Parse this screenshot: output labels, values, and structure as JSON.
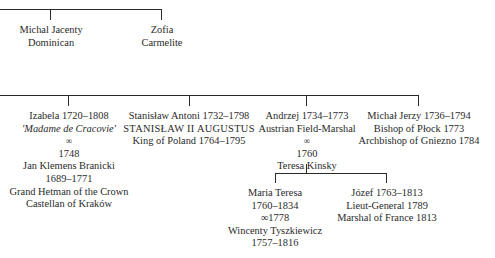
{
  "generation_1": [
    {
      "lines": [
        "Michal Jacenty",
        "Dominican"
      ]
    },
    {
      "lines": [
        "Zofia",
        "Carmelite"
      ]
    }
  ],
  "generation_2": [
    {
      "name": "Izabela 1720–1808",
      "nickname": "'Madame de Cracovie'",
      "marriage_symbol": "∞",
      "marriage_year": "1748",
      "spouse": "Jan Klemens Branicki",
      "spouse_dates": "1689–1771",
      "titles": [
        "Grand Hetman of the Crown",
        "Castellan of Kraków"
      ]
    },
    {
      "name": "Stanisław Antoni 1732–1798",
      "regnal_name": "STANISŁAW II AUGUSTUS",
      "title": "King of Poland 1764–1795"
    },
    {
      "name": "Andrzej 1734–1773",
      "title": "Austrian Field-Marshal",
      "marriage_symbol": "∞",
      "marriage_year": "1760",
      "spouse": "Teresa Kinsky"
    },
    {
      "name": "Michał Jerzy 1736–1794",
      "titles": [
        "Bishop of Płock 1773",
        "Archbishop of Gniezno 1784"
      ]
    }
  ],
  "generation_3": [
    {
      "name": "Maria Teresa",
      "dates": "1760–1834",
      "marriage": "∞1778",
      "spouse": "Wincenty Tyszkiewicz",
      "spouse_dates": "1757–1816"
    },
    {
      "name": "Józef 1763–1813",
      "titles": [
        "Lieut-General 1789",
        "Marshal of France 1813"
      ]
    }
  ]
}
